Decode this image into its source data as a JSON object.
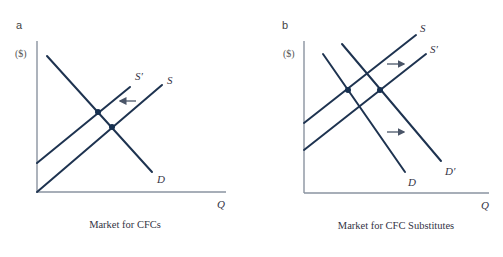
{
  "panels": [
    {
      "id": "a",
      "letter": "a",
      "y_unit": "($)",
      "x_label": "Q",
      "caption": "Market for CFCs",
      "curves": {
        "S": "S",
        "S_prime": "S′",
        "D": "D"
      },
      "shift": "Supply shifts left (S to S′)",
      "arrow_direction": "left"
    },
    {
      "id": "b",
      "letter": "b",
      "y_unit": "($)",
      "x_label": "Q",
      "caption": "Market for CFC Substitutes",
      "curves": {
        "S": "S",
        "S_prime": "S′",
        "D": "D",
        "D_prime": "D′"
      },
      "shift": "Supply and demand shift right",
      "arrow_direction": "right"
    }
  ],
  "colors": {
    "curve": "#1e3350",
    "axis": "#8a93a0",
    "arrow": "#4a5568"
  }
}
